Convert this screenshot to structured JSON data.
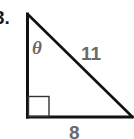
{
  "problem": {
    "number_label": "3."
  },
  "figure": {
    "type": "right-triangle",
    "angle_label": "θ",
    "hypotenuse_label": "11",
    "base_label": "8",
    "right_angle_marker": true,
    "vertices": {
      "top": [
        27.5,
        14
      ],
      "bottom_left": [
        27.5,
        117
      ],
      "bottom_right": [
        133,
        117
      ]
    },
    "colors": {
      "stroke": "#111111",
      "label": "#6a6a6a",
      "marker": "#333333"
    }
  }
}
